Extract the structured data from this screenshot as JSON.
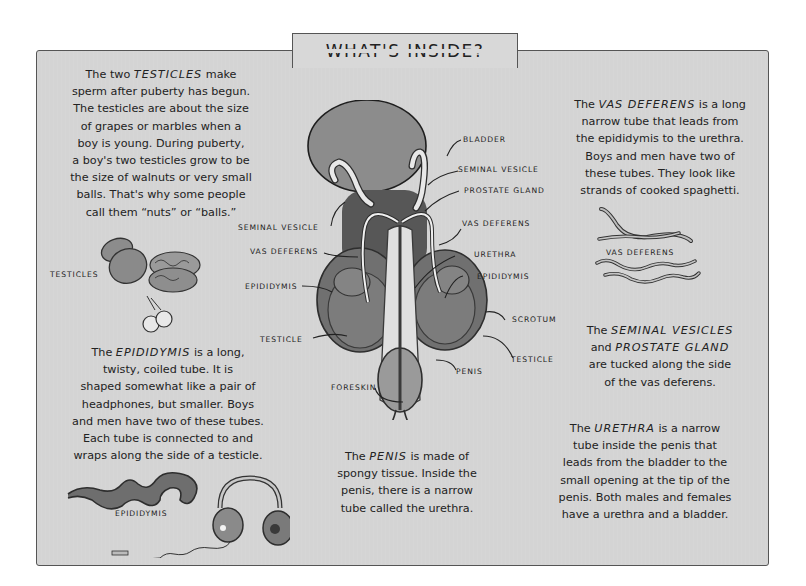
{
  "title": "WHAT'S INSIDE?",
  "colors": {
    "panel_background": "#d4d4d4",
    "panel_border": "#555555",
    "organ_fill": "#8a8a8a",
    "organ_dark": "#4e4e4e",
    "text": "#222222"
  },
  "paragraphs": {
    "testicles": {
      "lines": [
        [
          "The two ",
          "TESTICLES",
          " make"
        ],
        "sperm after puberty has begun.",
        "The testicles are about the size",
        "of grapes or marbles when a",
        "boy is young. During puberty,",
        "a boy's two testicles grow to be",
        "the size of walnuts or very small",
        "balls. That's why some people",
        "call them “nuts” or “balls.”"
      ]
    },
    "epididymis": {
      "lines": [
        [
          "The ",
          "EPIDIDYMIS",
          " is a long,"
        ],
        "twisty, coiled tube. It is",
        "shaped somewhat like a pair of",
        "headphones, but smaller. Boys",
        "and men have two of these tubes.",
        "Each tube is connected to and",
        "wraps along the side of a testicle."
      ]
    },
    "vas_deferens": {
      "lines": [
        [
          "The ",
          "VAS DEFERENS",
          " is a long"
        ],
        "narrow tube that leads from",
        "the epididymis to the urethra.",
        "Boys and men have two of",
        "these tubes. They look like",
        "strands of cooked spaghetti."
      ]
    },
    "seminal_vesicles": {
      "lines": [
        [
          "The ",
          "SEMINAL VESICLES",
          ""
        ],
        [
          "and ",
          "PROSTATE GLAND",
          ""
        ],
        "are tucked along the side",
        "of the vas deferens."
      ]
    },
    "penis": {
      "lines": [
        [
          "The ",
          "PENIS",
          " is made of"
        ],
        "spongy tissue. Inside the",
        "penis, there is a narrow",
        "tube called the urethra."
      ]
    },
    "urethra": {
      "lines": [
        [
          "The ",
          "URETHRA",
          " is a narrow"
        ],
        "tube inside the penis that",
        "leads from the bladder to the",
        "small opening at the tip of the",
        "penis. Both males and females",
        "have a urethra and a bladder."
      ]
    }
  },
  "illustration_captions": {
    "testicles": "TESTICLES",
    "vas_deferens": "VAS DEFERENS",
    "epididymis": "EPIDIDYMIS"
  },
  "diagram_labels": {
    "bladder": "BLADDER",
    "seminal_vesicle_right": "SEMINAL VESICLE",
    "prostate_gland": "PROSTATE GLAND",
    "seminal_vesicle_left": "SEMINAL VESICLE",
    "vas_deferens_right": "VAS DEFERENS",
    "vas_deferens_left": "VAS DEFERENS",
    "urethra": "URETHRA",
    "epididymis_left": "EPIDIDYMIS",
    "epididymis_right": "EPIDIDYMIS",
    "scrotum": "SCROTUM",
    "testicle_left": "TESTICLE",
    "testicle_right": "TESTICLE",
    "penis": "PENIS",
    "foreskin": "FORESKIN"
  }
}
